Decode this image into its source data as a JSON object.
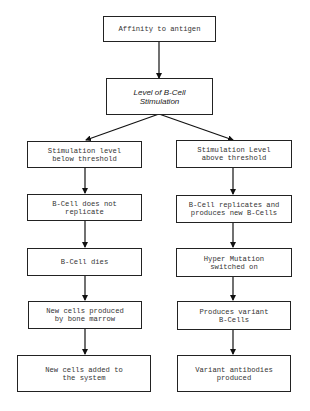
{
  "diagram": {
    "type": "flowchart",
    "nodes": {
      "root": {
        "label": "Affinity to antigen"
      },
      "decision": {
        "label": "Level of B-Cell\nStimulation"
      },
      "left": [
        {
          "label": "Stimulation level\nbelow threshold"
        },
        {
          "label": "B-Cell does not\nreplicate"
        },
        {
          "label": "B-Cell dies"
        },
        {
          "label": "New cells produced\nby bone marrow"
        },
        {
          "label": "New cells added to\nthe system"
        }
      ],
      "right": [
        {
          "label": "Stimulation Level\nabove threshold"
        },
        {
          "label": "B-Cell replicates and\nproduces new B-Cells"
        },
        {
          "label": "Hyper Mutation\nswitched on"
        },
        {
          "label": "Produces variant\nB-Cells"
        },
        {
          "label": "Variant antibodies\nproduced"
        }
      ]
    },
    "edges": [
      {
        "from": "root",
        "to": "decision"
      },
      {
        "from": "decision",
        "to": "left.0"
      },
      {
        "from": "decision",
        "to": "right.0"
      },
      {
        "from": "left.0",
        "to": "left.1"
      },
      {
        "from": "left.1",
        "to": "left.2"
      },
      {
        "from": "left.2",
        "to": "left.3"
      },
      {
        "from": "left.3",
        "to": "left.4"
      },
      {
        "from": "right.0",
        "to": "right.1"
      },
      {
        "from": "right.1",
        "to": "right.2"
      },
      {
        "from": "right.2",
        "to": "right.3"
      },
      {
        "from": "right.3",
        "to": "right.4"
      }
    ],
    "colors": {
      "stroke": "#222222",
      "text": "#333333",
      "background": "#ffffff"
    }
  }
}
